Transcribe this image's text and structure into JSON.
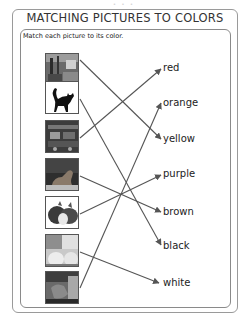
{
  "page": {
    "title": "MATCHING PICTURES TO COLORS",
    "instruction": "Match each picture to its color."
  },
  "pictures": [
    {
      "id": 1,
      "subject": "city-street-taxis",
      "matches": "yellow"
    },
    {
      "id": 2,
      "subject": "black-cat",
      "matches": "black"
    },
    {
      "id": 3,
      "subject": "fire-truck",
      "matches": "red"
    },
    {
      "id": 4,
      "subject": "dog",
      "matches": "brown"
    },
    {
      "id": 5,
      "subject": "onions",
      "matches": "purple"
    },
    {
      "id": 6,
      "subject": "eggs",
      "matches": "white"
    },
    {
      "id": 7,
      "subject": "fox",
      "matches": "orange"
    }
  ],
  "colors": [
    "red",
    "orange",
    "yellow",
    "purple",
    "brown",
    "black",
    "white"
  ],
  "style": {
    "line_color": "#555555",
    "border_color": "#8a8a8a"
  }
}
